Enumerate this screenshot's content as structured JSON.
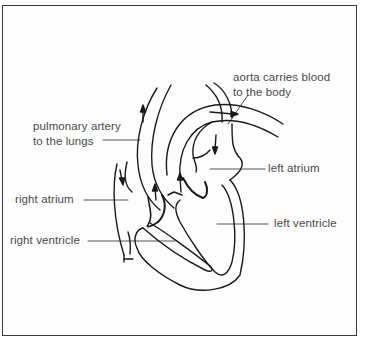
{
  "diagram": {
    "labels": {
      "aorta": [
        "aorta carries blood",
        "to the body"
      ],
      "pulmonary_artery": [
        "pulmonary artery",
        "to the lungs"
      ],
      "left_atrium": "left atrium",
      "right_atrium": "right atrium",
      "left_ventricle": "left ventricle",
      "right_ventricle": "right ventricle"
    },
    "colors": {
      "stroke": "#1a1a1a",
      "label_text": "#4a4a4a",
      "border": "#3a3a3a",
      "background": "#ffffff"
    }
  }
}
